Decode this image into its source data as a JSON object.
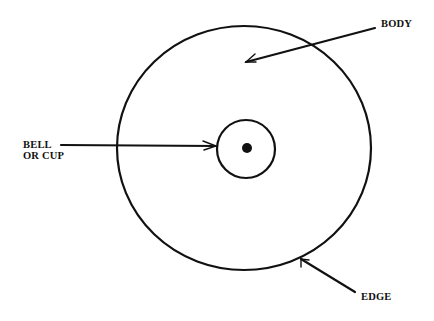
{
  "diagram": {
    "labels": {
      "body": "BODY",
      "bell_line1": "BELL",
      "bell_line2": "OR CUP",
      "edge": "EDGE"
    },
    "colors": {
      "ink": "#111111",
      "background": "#ffffff"
    }
  }
}
